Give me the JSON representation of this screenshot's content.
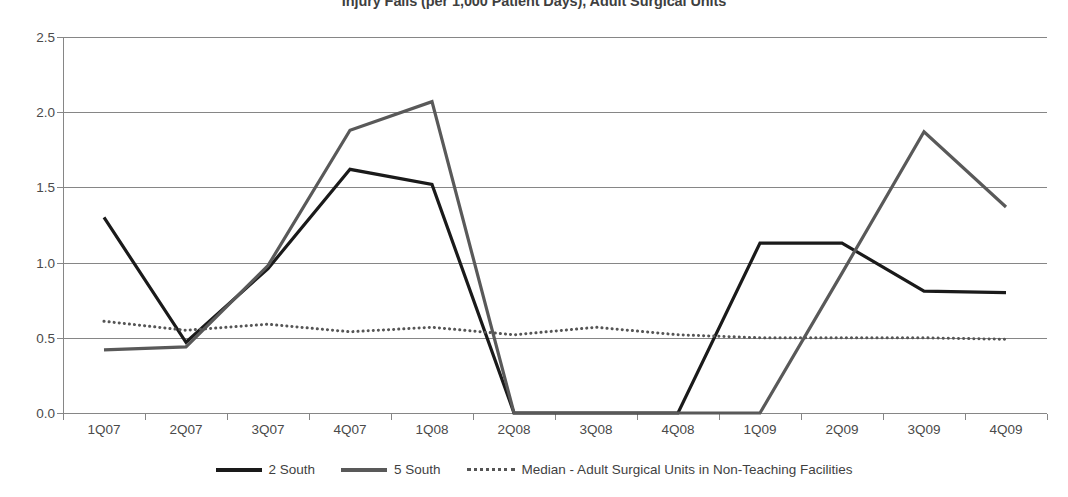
{
  "chart_data": {
    "type": "line",
    "title": "Injury Falls (per 1,000 Patient Days), Adult Surgical Units",
    "xlabel": "",
    "ylabel": "",
    "ylim": [
      0.0,
      2.5
    ],
    "yticks": [
      "0.0",
      "0.5",
      "1.0",
      "1.5",
      "2.0",
      "2.5"
    ],
    "ytick_values": [
      0.0,
      0.5,
      1.0,
      1.5,
      2.0,
      2.5
    ],
    "grid": true,
    "legend_position": "bottom",
    "categories": [
      "1Q07",
      "2Q07",
      "3Q07",
      "4Q07",
      "1Q08",
      "2Q08",
      "3Q08",
      "4Q08",
      "1Q09",
      "2Q09",
      "3Q09",
      "4Q09"
    ],
    "series": [
      {
        "name": "2 South",
        "style": "solid",
        "color": "#1a1a1a",
        "values": [
          1.3,
          0.47,
          0.96,
          1.62,
          1.52,
          0.0,
          0.0,
          0.0,
          1.13,
          1.13,
          0.81,
          0.8
        ]
      },
      {
        "name": "5 South",
        "style": "solid",
        "color": "#595959",
        "values": [
          0.42,
          0.44,
          0.98,
          1.88,
          2.07,
          0.0,
          0.0,
          0.0,
          0.0,
          0.93,
          1.87,
          1.37
        ]
      },
      {
        "name": "Median - Adult Surgical Units in Non-Teaching Facilities",
        "style": "dotted",
        "color": "#555555",
        "values": [
          0.61,
          0.55,
          0.59,
          0.54,
          0.57,
          0.52,
          0.57,
          0.52,
          0.5,
          0.5,
          0.5,
          0.49
        ]
      }
    ]
  },
  "legend": {
    "items": [
      {
        "label": "2 South"
      },
      {
        "label": "5 South"
      },
      {
        "label": "Median - Adult Surgical Units in Non-Teaching Facilities"
      }
    ]
  }
}
